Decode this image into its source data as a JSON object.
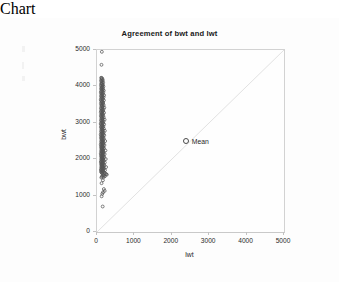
{
  "chart_data": {
    "type": "scatter",
    "title": "Agreement of bwt and lwt",
    "xlabel": "lwt",
    "ylabel": "bwt",
    "xlim": [
      0,
      5000
    ],
    "ylim": [
      0,
      5000
    ],
    "xticks": [
      0,
      1000,
      2000,
      3000,
      4000,
      5000
    ],
    "yticks": [
      0,
      1000,
      2000,
      3000,
      4000,
      5000
    ],
    "xtick_labels": [
      "0",
      "1000",
      "2000",
      "3000",
      "4000",
      "5000"
    ],
    "ytick_labels": [
      "0",
      "1000",
      "2000",
      "3000",
      "4000",
      "5000"
    ],
    "grid": false,
    "legend_position": "inside-center",
    "marker": "open-circle",
    "marker_color": "#555555",
    "reference_line": {
      "name": "identity-line",
      "from": [
        0,
        0
      ],
      "to": [
        5000,
        5000
      ],
      "color": "#e2e2e2",
      "style": "solid"
    },
    "annotations": [
      {
        "name": "mean-marker",
        "label": "Mean",
        "x": 2400,
        "y": 2450,
        "marker": "open-circle"
      }
    ],
    "series": [
      {
        "name": "bwt vs lwt",
        "points": [
          [
            130,
            4950
          ],
          [
            120,
            4593
          ],
          [
            110,
            4238
          ],
          [
            128,
            4230
          ],
          [
            142,
            4210
          ],
          [
            118,
            4190
          ],
          [
            155,
            4174
          ],
          [
            108,
            4153
          ],
          [
            135,
            4146
          ],
          [
            165,
            4111
          ],
          [
            122,
            4100
          ],
          [
            146,
            4082
          ],
          [
            112,
            4075
          ],
          [
            131,
            4054
          ],
          [
            158,
            4040
          ],
          [
            105,
            4025
          ],
          [
            140,
            4010
          ],
          [
            172,
            3997
          ],
          [
            119,
            3980
          ],
          [
            150,
            3969
          ],
          [
            127,
            3950
          ],
          [
            109,
            3941
          ],
          [
            163,
            3920
          ],
          [
            136,
            3912
          ],
          [
            115,
            3900
          ],
          [
            181,
            3884
          ],
          [
            144,
            3870
          ],
          [
            124,
            3855
          ],
          [
            102,
            3841
          ],
          [
            168,
            3827
          ],
          [
            139,
            3810
          ],
          [
            113,
            3799
          ],
          [
            153,
            3785
          ],
          [
            129,
            3770
          ],
          [
            190,
            3756
          ],
          [
            107,
            3742
          ],
          [
            147,
            3730
          ],
          [
            121,
            3714
          ],
          [
            175,
            3700
          ],
          [
            133,
            3688
          ],
          [
            111,
            3674
          ],
          [
            159,
            3660
          ],
          [
            142,
            3645
          ],
          [
            100,
            3630
          ],
          [
            185,
            3617
          ],
          [
            126,
            3600
          ],
          [
            151,
            3586
          ],
          [
            117,
            3572
          ],
          [
            138,
            3558
          ],
          [
            166,
            3544
          ],
          [
            104,
            3530
          ],
          [
            145,
            3515
          ],
          [
            123,
            3500
          ],
          [
            178,
            3487
          ],
          [
            132,
            3473
          ],
          [
            114,
            3459
          ],
          [
            156,
            3445
          ],
          [
            141,
            3430
          ],
          [
            196,
            3416
          ],
          [
            106,
            3402
          ],
          [
            148,
            3388
          ],
          [
            120,
            3374
          ],
          [
            170,
            3360
          ],
          [
            134,
            3346
          ],
          [
            110,
            3332
          ],
          [
            161,
            3318
          ],
          [
            143,
            3304
          ],
          [
            101,
            3290
          ],
          [
            188,
            3276
          ],
          [
            125,
            3263
          ],
          [
            152,
            3249
          ],
          [
            116,
            3235
          ],
          [
            137,
            3221
          ],
          [
            167,
            3207
          ],
          [
            103,
            3193
          ],
          [
            146,
            3180
          ],
          [
            122,
            3167
          ],
          [
            179,
            3153
          ],
          [
            130,
            3140
          ],
          [
            113,
            3126
          ],
          [
            157,
            3113
          ],
          [
            140,
            3100
          ],
          [
            203,
            3086
          ],
          [
            108,
            3073
          ],
          [
            149,
            3060
          ],
          [
            119,
            3047
          ],
          [
            172,
            3034
          ],
          [
            135,
            3021
          ],
          [
            112,
            3008
          ],
          [
            162,
            2995
          ],
          [
            144,
            2982
          ],
          [
            99,
            2969
          ],
          [
            191,
            2956
          ],
          [
            127,
            2943
          ],
          [
            154,
            2930
          ],
          [
            118,
            2918
          ],
          [
            139,
            2905
          ],
          [
            169,
            2892
          ],
          [
            105,
            2880
          ],
          [
            147,
            2867
          ],
          [
            124,
            2855
          ],
          [
            182,
            2842
          ],
          [
            131,
            2830
          ],
          [
            115,
            2818
          ],
          [
            158,
            2805
          ],
          [
            142,
            2793
          ],
          [
            210,
            2781
          ],
          [
            109,
            2768
          ],
          [
            150,
            2756
          ],
          [
            121,
            2744
          ],
          [
            174,
            2732
          ],
          [
            136,
            2720
          ],
          [
            114,
            2708
          ],
          [
            164,
            2696
          ],
          [
            145,
            2684
          ],
          [
            100,
            2672
          ],
          [
            195,
            2660
          ],
          [
            128,
            2648
          ],
          [
            155,
            2636
          ],
          [
            117,
            2625
          ],
          [
            138,
            2613
          ],
          [
            171,
            2601
          ],
          [
            106,
            2590
          ],
          [
            148,
            2578
          ],
          [
            123,
            2567
          ],
          [
            185,
            2555
          ],
          [
            132,
            2544
          ],
          [
            116,
            2532
          ],
          [
            159,
            2521
          ],
          [
            143,
            2510
          ],
          [
            218,
            2498
          ],
          [
            110,
            2487
          ],
          [
            151,
            2476
          ],
          [
            122,
            2465
          ],
          [
            176,
            2454
          ],
          [
            137,
            2443
          ],
          [
            113,
            2432
          ],
          [
            166,
            2421
          ],
          [
            146,
            2410
          ],
          [
            101,
            2399
          ],
          [
            199,
            2388
          ],
          [
            129,
            2377
          ],
          [
            156,
            2366
          ],
          [
            118,
            2356
          ],
          [
            140,
            2345
          ],
          [
            173,
            2334
          ],
          [
            107,
            2324
          ],
          [
            149,
            2313
          ],
          [
            125,
            2303
          ],
          [
            188,
            2292
          ],
          [
            133,
            2282
          ],
          [
            117,
            2271
          ],
          [
            161,
            2261
          ],
          [
            144,
            2251
          ],
          [
            226,
            2240
          ],
          [
            111,
            2230
          ],
          [
            152,
            2220
          ],
          [
            123,
            2210
          ],
          [
            178,
            2199
          ],
          [
            138,
            2189
          ],
          [
            115,
            2179
          ],
          [
            168,
            2169
          ],
          [
            147,
            2159
          ],
          [
            102,
            2149
          ],
          [
            204,
            2139
          ],
          [
            130,
            2129
          ],
          [
            157,
            2119
          ],
          [
            119,
            2110
          ],
          [
            141,
            2100
          ],
          [
            175,
            2090
          ],
          [
            108,
            2080
          ],
          [
            150,
            2070
          ],
          [
            126,
            2061
          ],
          [
            192,
            2051
          ],
          [
            134,
            2041
          ],
          [
            118,
            2032
          ],
          [
            163,
            2022
          ],
          [
            145,
            2013
          ],
          [
            234,
            2003
          ],
          [
            112,
            1994
          ],
          [
            153,
            1984
          ],
          [
            124,
            1975
          ],
          [
            181,
            1965
          ],
          [
            139,
            1956
          ],
          [
            116,
            1947
          ],
          [
            170,
            1937
          ],
          [
            148,
            1928
          ],
          [
            103,
            1919
          ],
          [
            209,
            1909
          ],
          [
            131,
            1900
          ],
          [
            158,
            1891
          ],
          [
            120,
            1882
          ],
          [
            142,
            1873
          ],
          [
            177,
            1864
          ],
          [
            109,
            1855
          ],
          [
            151,
            1846
          ],
          [
            127,
            1837
          ],
          [
            196,
            1828
          ],
          [
            135,
            1819
          ],
          [
            119,
            1810
          ],
          [
            165,
            1801
          ],
          [
            146,
            1792
          ],
          [
            243,
            1783
          ],
          [
            113,
            1774
          ],
          [
            154,
            1766
          ],
          [
            125,
            1757
          ],
          [
            184,
            1748
          ],
          [
            140,
            1740
          ],
          [
            117,
            1731
          ],
          [
            172,
            1722
          ],
          [
            149,
            1714
          ],
          [
            104,
            1705
          ],
          [
            214,
            1697
          ],
          [
            132,
            1688
          ],
          [
            159,
            1680
          ],
          [
            121,
            1671
          ],
          [
            143,
            1663
          ],
          [
            180,
            1655
          ],
          [
            110,
            1646
          ],
          [
            152,
            1638
          ],
          [
            128,
            1630
          ],
          [
            200,
            1622
          ],
          [
            136,
            1613
          ],
          [
            227,
            1600
          ],
          [
            247,
            1588
          ],
          [
            263,
            1576
          ],
          [
            168,
            1565
          ],
          [
            190,
            1553
          ],
          [
            145,
            1541
          ],
          [
            210,
            1530
          ],
          [
            131,
            1518
          ],
          [
            175,
            1506
          ],
          [
            116,
            1495
          ],
          [
            158,
            1420
          ],
          [
            122,
            1340
          ],
          [
            183,
            1180
          ],
          [
            205,
            1130
          ],
          [
            161,
            1090
          ],
          [
            142,
            1050
          ],
          [
            124,
            980
          ],
          [
            152,
            700
          ]
        ]
      }
    ]
  }
}
